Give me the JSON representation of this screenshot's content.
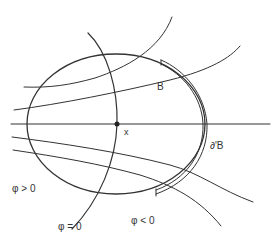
{
  "figure": {
    "labels": {
      "B": "B",
      "boundary": "∂'B",
      "point": "x",
      "phi_positive": "φ > 0",
      "phi_zero": "φ = 0",
      "phi_negative": "φ < 0"
    },
    "colors": {
      "stroke": "#333333",
      "background": "#ffffff"
    },
    "elements": [
      {
        "type": "ellipse",
        "name": "region-B",
        "cx": 116,
        "cy": 124,
        "rx": 89,
        "ry": 70
      },
      {
        "type": "double-arc",
        "name": "boundary-prime-B",
        "from": [
          160,
          62
        ],
        "to": [
          155,
          192
        ]
      },
      {
        "type": "point",
        "name": "x",
        "at": [
          117,
          124
        ]
      },
      {
        "type": "curve",
        "name": "level-set-phi-zero"
      },
      {
        "type": "curves",
        "name": "field-lines",
        "count": 5
      }
    ]
  }
}
